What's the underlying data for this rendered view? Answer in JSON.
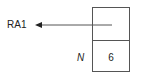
{
  "diagram": {
    "pointer_label": "RA1",
    "cells": [
      {
        "label": "",
        "value": ""
      },
      {
        "label": "N",
        "value": "6"
      }
    ],
    "colors": {
      "line": "#555555",
      "text": "#222222"
    }
  }
}
